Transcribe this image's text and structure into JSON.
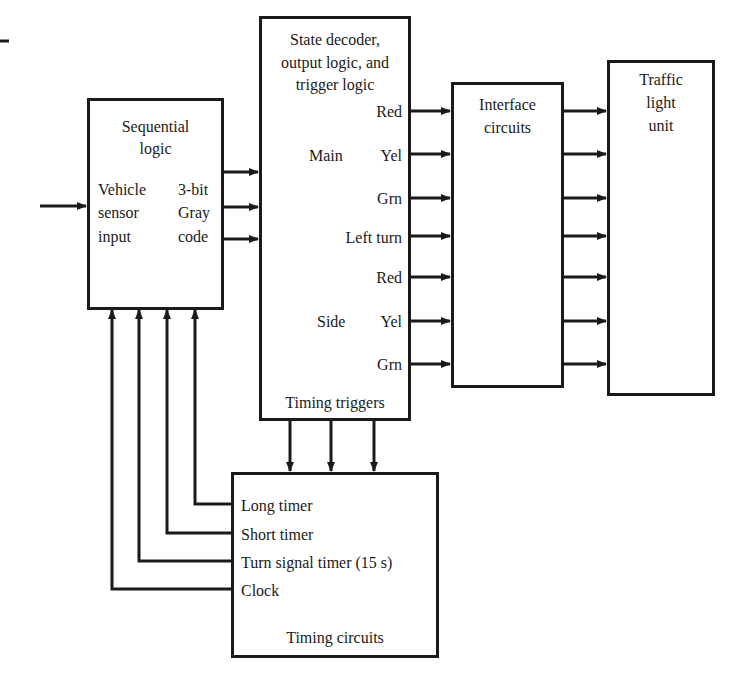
{
  "blocks": {
    "sequential": {
      "title_line1": "Sequential",
      "title_line2": "logic",
      "input_label": [
        "Vehicle",
        "sensor",
        "input"
      ],
      "output_label": [
        "3-bit",
        "Gray",
        "code"
      ]
    },
    "decoder": {
      "title": [
        "State decoder,",
        "output logic, and",
        "trigger logic"
      ],
      "main_group": "Main",
      "main_signals": [
        "Red",
        "Yel",
        "Grn"
      ],
      "left_turn": "Left turn",
      "side_group": "Side",
      "side_signals": [
        "Red",
        "Yel",
        "Grn"
      ],
      "footer": "Timing triggers"
    },
    "interface": {
      "title": [
        "Interface",
        "circuits"
      ]
    },
    "traffic": {
      "title": [
        "Traffic",
        "light",
        "unit"
      ]
    },
    "timing": {
      "signals": [
        "Long timer",
        "Short timer",
        "Turn signal timer (15 s)",
        "Clock"
      ],
      "footer": "Timing circuits"
    }
  },
  "connections": {
    "decoder_to_interface_count": 7,
    "interface_to_traffic_count": 7,
    "sequential_to_decoder_count": 3,
    "decoder_to_timing_count": 3,
    "timing_to_sequential_count": 4
  }
}
